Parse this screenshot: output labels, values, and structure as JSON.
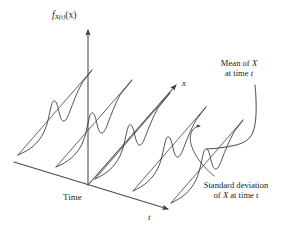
{
  "figure": {
    "background_color": "#ffffff",
    "line_color": "#333333",
    "axis_color": "#4a4a4a",
    "width": 288,
    "height": 237,
    "caption_style": "3D perspective stochastic process density diagram"
  },
  "labels": {
    "density_axis": {
      "text": "f_X(t)(x)",
      "base": "f",
      "subscript": "X(t)",
      "argument": "(x)"
    },
    "time_axis": "Time",
    "x_axis": "x",
    "t_axis": "t",
    "mean_annotation_line1": "Mean of X",
    "mean_annotation_line2": "at time t",
    "mean_annotation_full": "Mean of X at time t",
    "stddev_annotation_line1": "Standard deviation",
    "stddev_annotation_line2": "of X at time t",
    "stddev_annotation_full": "Standard deviation of X at time t"
  },
  "chart_data": {
    "type": "line",
    "title": "",
    "subtitle": "",
    "xlabel": "t",
    "ylabel": "f_X(t)(x)",
    "zlabel": "x",
    "grid": false,
    "legend": "none",
    "projection": "3d-oblique",
    "axes": {
      "t_axis": {
        "label": "t",
        "direction": "down-right",
        "origin_px": [
          88,
          185
        ],
        "end_px": [
          172,
          211
        ],
        "arrow": true
      },
      "x_axis": {
        "label": "x",
        "direction": "up-right",
        "origin_px": [
          88,
          185
        ],
        "end_px": [
          178,
          83
        ],
        "arrow": true
      },
      "density_axis": {
        "label": "f_X(t)(x)",
        "direction": "up",
        "origin_px": [
          88,
          185
        ],
        "end_px": [
          88,
          27
        ],
        "arrow": true
      }
    },
    "series": [
      {
        "name": "density at t1",
        "time_index": 1,
        "baseline_start_px": [
          18,
          155
        ],
        "peak_px": [
          54,
          103
        ],
        "peak_height_rel": 1.0,
        "shoulder_height_rel": 0.62
      },
      {
        "name": "density at t2",
        "time_index": 2,
        "baseline_start_px": [
          58,
          168
        ],
        "peak_px": [
          94,
          106
        ],
        "peak_height_rel": 1.0,
        "shoulder_height_rel": 0.6
      },
      {
        "name": "density at t3",
        "time_index": 3,
        "baseline_start_px": [
          96,
          180
        ],
        "peak_px": [
          128,
          110
        ],
        "peak_height_rel": 0.95,
        "shoulder_height_rel": 0.58
      },
      {
        "name": "density at t4",
        "time_index": 4,
        "baseline_start_px": [
          134,
          192
        ],
        "peak_px": [
          164,
          114
        ],
        "peak_height_rel": 0.92,
        "shoulder_height_rel": 0.56
      },
      {
        "name": "density at t5",
        "time_index": 5,
        "baseline_start_px": [
          172,
          204
        ],
        "peak_px": [
          198,
          119
        ],
        "peak_height_rel": 0.88,
        "shoulder_height_rel": 0.55
      }
    ],
    "mean_curve": {
      "name": "Mean of X at time t",
      "points_px": [
        [
          198,
          145
        ],
        [
          222,
          142
        ],
        [
          244,
          136
        ],
        [
          254,
          118
        ],
        [
          256,
          96
        ]
      ],
      "annotation": "Mean of X at time t"
    },
    "stddev_marker": {
      "name": "Standard deviation of X at time t",
      "arrow_tip_px": [
        200,
        126
      ],
      "leader_from_px": [
        214,
        178
      ],
      "annotation": "Standard deviation of X at time t"
    }
  }
}
